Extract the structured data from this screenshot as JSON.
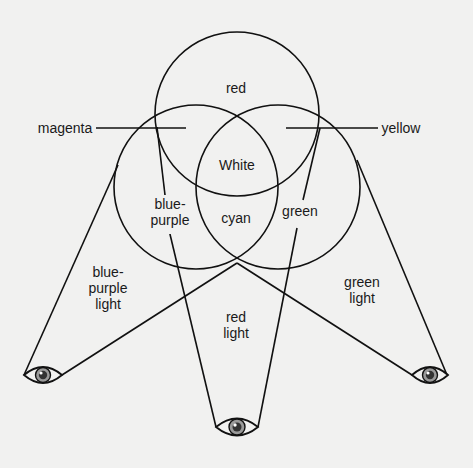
{
  "diagram": {
    "title": "",
    "circles": [
      {
        "name": "red-circle"
      },
      {
        "name": "blue-purple-circle"
      },
      {
        "name": "green-circle"
      }
    ],
    "region_labels": {
      "top": "red",
      "center": "White",
      "left_inner": [
        "blue-",
        "purple"
      ],
      "bottom_inner": "cyan",
      "right_inner": "green"
    },
    "callout_labels": {
      "left": "magenta",
      "right": "yellow"
    },
    "light_labels": {
      "left": [
        "blue-",
        "purple",
        "light"
      ],
      "center": [
        "red",
        "light"
      ],
      "right": [
        "green",
        "light"
      ]
    },
    "eyes": [
      {
        "name": "left-eye",
        "label": "eye"
      },
      {
        "name": "bottom-eye",
        "label": "eye"
      },
      {
        "name": "right-eye",
        "label": "eye"
      }
    ],
    "colors": {
      "line": "#111111",
      "background": "#f1f1f0",
      "iris": "#9a9a9a",
      "pupil": "#333333"
    }
  }
}
